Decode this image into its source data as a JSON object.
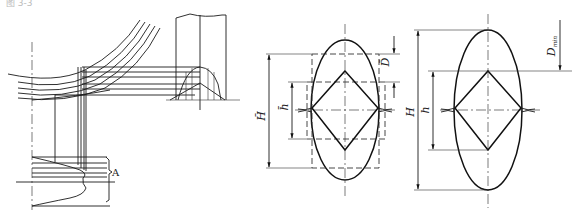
{
  "figure": {
    "caption_fragment": "图 3-3",
    "left_panel": {
      "label_A": "A"
    },
    "middle_panel": {
      "label_H_bar": "H̄",
      "label_h_bar": "h̄",
      "label_D_bar": "D̄"
    },
    "right_panel": {
      "label_H": "H",
      "label_h": "h",
      "label_D_main": "D",
      "label_D_sub": "min"
    }
  }
}
